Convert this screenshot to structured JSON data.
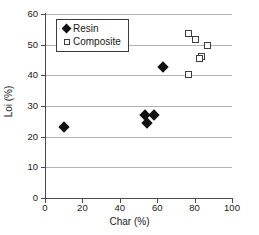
{
  "chart_data": {
    "type": "scatter",
    "title": "",
    "xlabel": "Char (%)",
    "ylabel": "Loi (%)",
    "xlim": [
      0,
      100
    ],
    "ylim": [
      0,
      60
    ],
    "xticks": [
      0,
      20,
      40,
      60,
      80,
      100
    ],
    "yticks": [
      0,
      10,
      20,
      30,
      40,
      50,
      60
    ],
    "grid": "horizontal",
    "legend_position": "top-left",
    "series": [
      {
        "name": "Resin",
        "marker": "filled-diamond",
        "color": "#111111",
        "points": [
          {
            "x": 10.0,
            "y": 23.1
          },
          {
            "x": 53.5,
            "y": 27.0
          },
          {
            "x": 54.5,
            "y": 24.4
          },
          {
            "x": 58.5,
            "y": 27.0
          },
          {
            "x": 63.0,
            "y": 42.7
          }
        ]
      },
      {
        "name": "Composite",
        "marker": "open-square",
        "color": "#3c3c3c",
        "points": [
          {
            "x": 77.0,
            "y": 53.5
          },
          {
            "x": 80.5,
            "y": 51.7
          },
          {
            "x": 87.0,
            "y": 49.7
          },
          {
            "x": 83.5,
            "y": 46.2
          },
          {
            "x": 82.5,
            "y": 45.4
          },
          {
            "x": 77.0,
            "y": 40.4
          }
        ]
      }
    ]
  },
  "axes": {
    "x_title": "Char (%)",
    "y_title": "Loi (%)",
    "x_tick_labels": [
      "0",
      "20",
      "40",
      "60",
      "80",
      "100"
    ],
    "y_tick_labels": [
      "0",
      "10",
      "20",
      "30",
      "40",
      "50",
      "60"
    ]
  },
  "legend": {
    "entries": [
      {
        "label": "Resin",
        "symbol": "filled-diamond-icon"
      },
      {
        "label": "Composite",
        "symbol": "open-square-icon"
      }
    ]
  }
}
